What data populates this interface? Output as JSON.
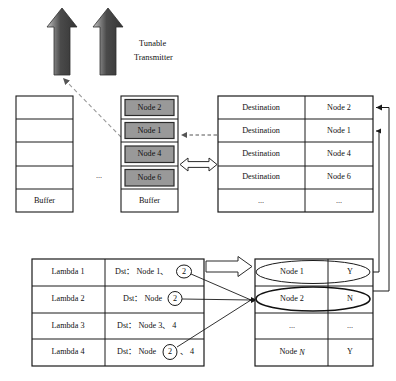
{
  "diagram": {
    "title_label": "Tunable Transmitter",
    "ellipsis": "...",
    "left_buffer": {
      "name": "left-buffer-column",
      "rows": [
        "",
        "",
        "",
        "",
        "Buffer"
      ],
      "buffer_label": "Buffer"
    },
    "node_buffer": {
      "name": "node-buffer-column",
      "nodes": [
        "Node 2",
        "Node 1",
        "Node 4",
        "Node 6"
      ],
      "buffer_label": "Buffer",
      "node_fill": "#999999",
      "node_border": "#2b2b2b"
    },
    "destination_table": {
      "name": "destination-table",
      "rows": [
        {
          "label": "Destination",
          "value": "Node 2"
        },
        {
          "label": "Destination",
          "value": "Node 1"
        },
        {
          "label": "Destination",
          "value": "Node 4"
        },
        {
          "label": "Destination",
          "value": "Node 6"
        },
        {
          "label": "...",
          "value": "..."
        }
      ]
    },
    "lambda_table": {
      "name": "lambda-table",
      "rows": [
        {
          "lambda": "Lambda 1",
          "dst": "Dst： Node 1、2",
          "dst_prefix": "Dst： Node 1、",
          "circled": "2",
          "dst_suffix": ""
        },
        {
          "lambda": "Lambda 2",
          "dst": "Dst： Node 2",
          "dst_prefix": "Dst： Node",
          "circled": "2",
          "dst_suffix": ""
        },
        {
          "lambda": "Lambda 3",
          "dst": "Dst： Node 3、4",
          "dst_prefix": "Dst： Node 3、 4",
          "circled": "",
          "dst_suffix": ""
        },
        {
          "lambda": "Lambda 4",
          "dst": "Dst： Node 2、4",
          "dst_prefix": "Dst： Node",
          "circled": "2",
          "dst_suffix": "、 4"
        }
      ]
    },
    "node_status_table": {
      "name": "node-status-table",
      "rows": [
        {
          "node": "Node 1",
          "status": "Y",
          "highlighted": "true"
        },
        {
          "node": "Node 2",
          "status": "N",
          "highlighted": "true"
        },
        {
          "node": "...",
          "status": "..."
        },
        {
          "node": "Node N",
          "node_prefix": "Node ",
          "node_italic": "N",
          "status": "Y"
        }
      ]
    },
    "arrows": {
      "transmitter_arrow_1": "up-arrow",
      "transmitter_arrow_2": "up-arrow",
      "exchange_arrow": "double-headed-arrow",
      "map_arrow": "block-right-arrow",
      "tune_arrow": "dashed-left-arrow"
    },
    "colors": {
      "arrow_dark": "#3c3c3c",
      "arrow_light": "#b9b9b9",
      "stroke": "#1a1a1a",
      "dashed": "#8e8e8e"
    }
  }
}
